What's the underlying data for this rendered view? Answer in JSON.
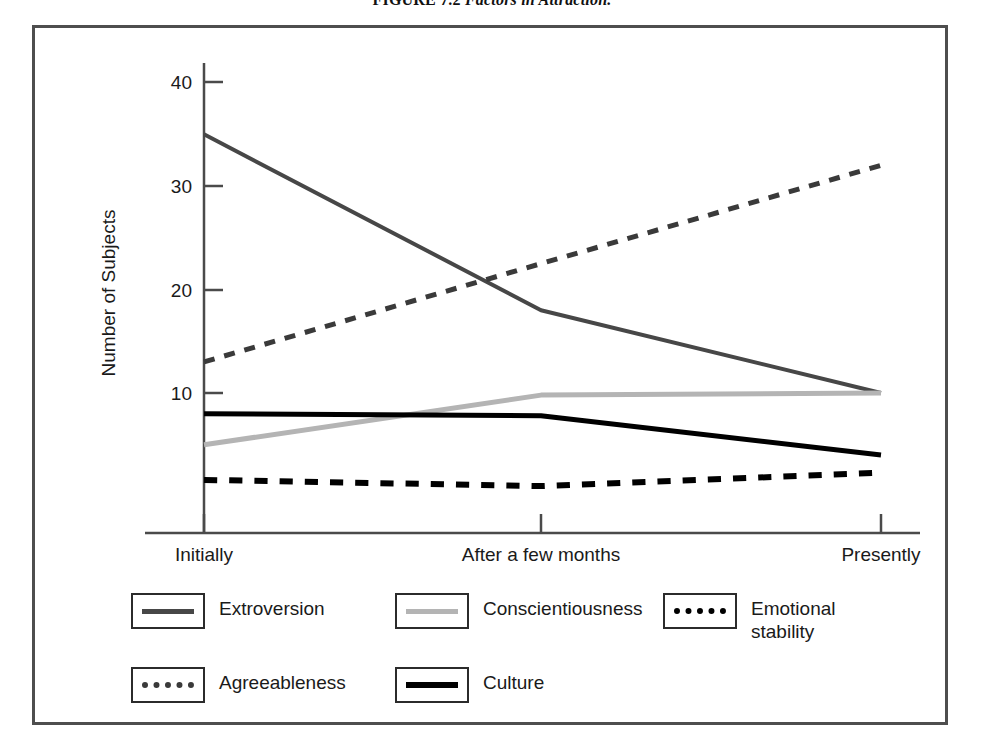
{
  "figure": {
    "caption_label": "FIGURE 7.2",
    "caption_title": "Factors in Attraction."
  },
  "chart_data": {
    "type": "line",
    "title": "Factors in Attraction.",
    "xlabel": "",
    "ylabel": "Number of Subjects",
    "categories": [
      "Initially",
      "After a few months",
      "Presently"
    ],
    "ylim": [
      0,
      43
    ],
    "yticks": [
      "10",
      "20",
      "30",
      "40"
    ],
    "ytick_values": [
      10,
      20,
      30,
      40
    ],
    "grid": false,
    "legend_position": "bottom",
    "series": [
      {
        "name": "Extroversion",
        "values": [
          35,
          18,
          10
        ],
        "color": "#474747",
        "style": "solid",
        "width": 4
      },
      {
        "name": "Agreeableness",
        "values": [
          13,
          22.5,
          32
        ],
        "color": "#3a3a3a",
        "style": "dashed",
        "width": 5
      },
      {
        "name": "Conscientiousness",
        "values": [
          5,
          9.8,
          10
        ],
        "color": "#b4b4b4",
        "style": "solid",
        "width": 5
      },
      {
        "name": "Culture",
        "values": [
          8,
          7.8,
          4
        ],
        "color": "#000000",
        "style": "solid",
        "width": 5
      },
      {
        "name": "Emotional stability",
        "values": [
          1.6,
          1.0,
          2.3
        ],
        "color": "#000000",
        "style": "dashed",
        "width": 6
      }
    ]
  },
  "axis": {
    "y_title": "Number of Subjects",
    "y_tick_0": "10",
    "y_tick_1": "20",
    "y_tick_2": "30",
    "y_tick_3": "40",
    "x_tick_0": "Initially",
    "x_tick_1": "After a few months",
    "x_tick_2": "Presently"
  },
  "legend": {
    "items": [
      {
        "label": "Extroversion",
        "swatch": "solid-dark"
      },
      {
        "label": "Conscientiousness",
        "swatch": "solid-light"
      },
      {
        "label": "Emotional\nstability",
        "label_line1": "Emotional",
        "label_line2": "stability",
        "swatch": "dotted-black"
      },
      {
        "label": "Agreeableness",
        "swatch": "dotted-gray"
      },
      {
        "label": "Culture",
        "swatch": "solid-black"
      }
    ]
  }
}
